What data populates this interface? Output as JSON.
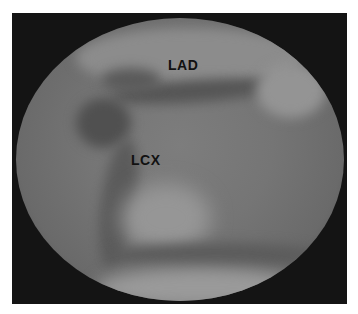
{
  "image": {
    "description": "Coronary angiogram (fluoroscopy) showing left coronary arteries",
    "labels": [
      {
        "text": "LAD",
        "x": 168,
        "y": 57
      },
      {
        "text": "LCX",
        "x": 131,
        "y": 152
      }
    ],
    "colors": {
      "border": "#141414",
      "field_light": "#8f8f8f",
      "field_mid": "#757575",
      "vessel_dark": "#4a4a4a",
      "label": "#111111"
    }
  }
}
